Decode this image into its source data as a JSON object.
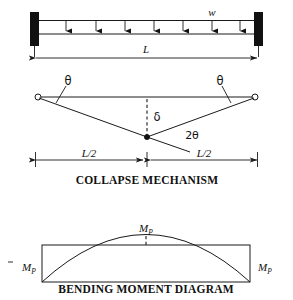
{
  "figure": {
    "title_top": "",
    "beam": {
      "load_label": "w",
      "span_label": "L",
      "support_left": "fixed-support",
      "support_right": "fixed-support",
      "arrow_count": 7
    },
    "mechanism": {
      "angle_left_label": "θ",
      "angle_right_label": "θ",
      "angle_center_label": "2θ",
      "deflection_label": "δ",
      "half_span_left_label": "L/2",
      "half_span_right_label": "L/2",
      "caption": "COLLAPSE MECHANISM"
    },
    "bmd": {
      "moment_top_label": "M",
      "moment_top_sub": "P",
      "moment_left_label": "M",
      "moment_left_sub": "P",
      "moment_right_label": "M",
      "moment_right_sub": "P",
      "caption": "BENDING MOMENT DIAGRAM"
    },
    "colors": {
      "ink": "#1a1a1a",
      "fill": "#111111",
      "background": "#ffffff"
    }
  }
}
